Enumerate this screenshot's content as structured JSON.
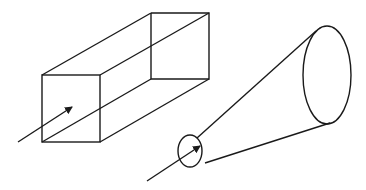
{
  "figure": {
    "stroke_color": "#1a1a1a",
    "background": "#ffffff",
    "shapes": [
      {
        "name": "rectangular-prism",
        "front_face": [
          42,
          75,
          100,
          142
        ],
        "back_face": [
          151,
          13,
          209,
          79
        ]
      },
      {
        "name": "truncated-cone",
        "small_end": {
          "cx": 190,
          "cy": 151,
          "rx": 12,
          "ry": 16
        },
        "large_end": {
          "cx": 327,
          "cy": 75,
          "rx": 24,
          "ry": 49
        }
      }
    ],
    "arrows": [
      {
        "name": "box-flow-arrow",
        "from": [
          18,
          142
        ],
        "to": [
          72,
          107
        ]
      },
      {
        "name": "cone-flow-arrow",
        "from": [
          147,
          181
        ],
        "to": [
          200,
          146
        ]
      }
    ]
  }
}
